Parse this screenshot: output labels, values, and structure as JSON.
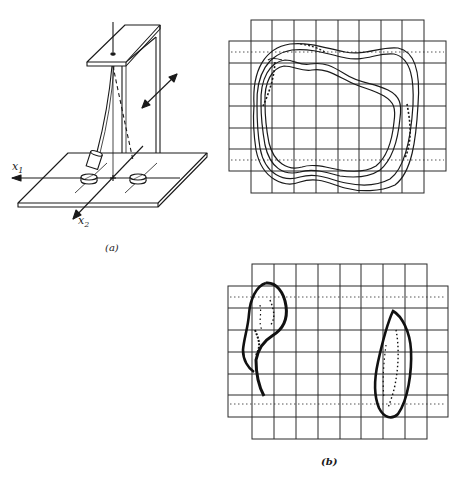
{
  "figure": {
    "panel_a": {
      "label": "(a)",
      "description": "Pendulum suspended from a stand over a base plate with two magnets",
      "axis_x1": {
        "name": "x",
        "sub": "1"
      },
      "axis_x2": {
        "name": "x",
        "sub": "2"
      }
    },
    "panel_b": {
      "label": "(b)",
      "description": "Oscilloscope grid traces of pendulum trajectories"
    },
    "colors": {
      "ink": "#1a1a1a",
      "grid": "#2a2a2a",
      "background": "#ffffff"
    }
  },
  "grids": [
    {
      "id": "top-trace",
      "rows": 8,
      "columns_inner": 8,
      "columns_outer": 10,
      "trace": "nested closed loops around the grid center"
    },
    {
      "id": "bottom-trace",
      "rows": 8,
      "columns_inner": 8,
      "columns_outer": 10,
      "trace": "two separate elongated blobs near left and right magnets"
    }
  ]
}
